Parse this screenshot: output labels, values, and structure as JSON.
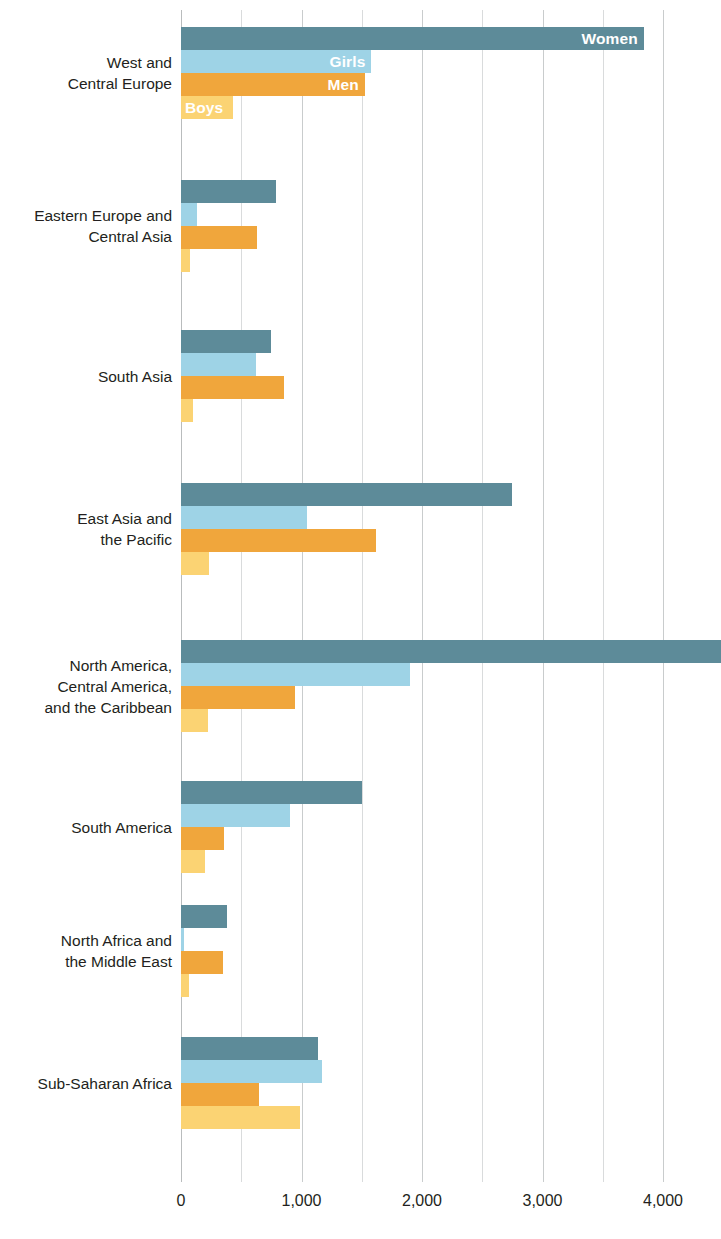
{
  "chart_data": {
    "type": "bar",
    "orientation": "horizontal",
    "title": "",
    "subtitle": "",
    "xlabel": "",
    "ylabel": "",
    "xlim": [
      0,
      4480
    ],
    "grid": true,
    "gridlines_every": 500,
    "legend_position": "in-bars-first-group",
    "axis_tick_labels": [
      "0",
      "1,000",
      "2,000",
      "3,000",
      "4,000"
    ],
    "axis_tick_values": [
      0,
      1000,
      2000,
      3000,
      4000
    ],
    "categories": [
      "West and\nCentral Europe",
      "Eastern Europe and\nCentral Asia",
      "South Asia",
      "East Asia and\nthe Pacific",
      "North America,\nCentral America,\nand the Caribbean",
      "South America",
      "North Africa and\nthe Middle East",
      "Sub-Saharan Africa"
    ],
    "series": [
      {
        "name": "Women",
        "color": "#5d8b99",
        "values": [
          3840,
          790,
          750,
          2745,
          4480,
          1500,
          380,
          1135
        ]
      },
      {
        "name": "Girls",
        "color": "#9ed3e6",
        "values": [
          1580,
          130,
          620,
          1045,
          1900,
          905,
          25,
          1170
        ]
      },
      {
        "name": "Men",
        "color": "#f0a63c",
        "values": [
          1525,
          630,
          855,
          1620,
          945,
          355,
          350,
          645
        ]
      },
      {
        "name": "Boys",
        "color": "#fbd373",
        "values": [
          430,
          75,
          100,
          230,
          225,
          200,
          70,
          985
        ]
      }
    ]
  },
  "labels": {
    "in_bar_labels": [
      "Women",
      "Girls",
      "Men",
      "Boys"
    ]
  }
}
